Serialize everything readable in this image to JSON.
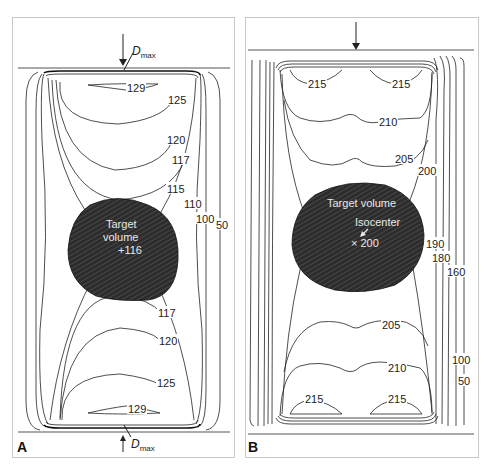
{
  "figure": {
    "panels": [
      {
        "letter": "A",
        "beam_label_main": "D",
        "beam_label_sub": "max",
        "target_label_line1": "Target",
        "target_label_line2": "volume",
        "target_dose": "+116",
        "isodose_labels": {
          "top_129": "129",
          "top_125": "125",
          "top_120": "120",
          "top_117": "117",
          "l115": "115",
          "l110": "110",
          "l100": "100",
          "l50": "50",
          "bot_117": "117",
          "bot_120": "120",
          "bot_125": "125",
          "bot_129": "129"
        }
      },
      {
        "letter": "B",
        "target_label": "Target volume",
        "isocenter_label": "Isocenter",
        "isocenter_dose": "× 200",
        "isodose_labels": {
          "top_215_left": "215",
          "top_215_right": "215",
          "top_210": "210",
          "top_205": "205",
          "l200": "200",
          "l190": "190",
          "l180": "180",
          "l160": "160",
          "bot_205": "205",
          "bot_210": "210",
          "l100": "100",
          "l50": "50",
          "bot_215_left": "215",
          "bot_215_right": "215"
        }
      }
    ],
    "colors": {
      "target_fill": "#2a2a2a",
      "line": "#222222",
      "frame": "#c8c8c8"
    }
  }
}
